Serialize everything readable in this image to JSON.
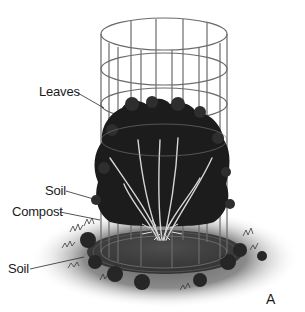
{
  "figure": {
    "panel_letter": "A",
    "labels": [
      {
        "id": "leaves",
        "text": "Leaves"
      },
      {
        "id": "soil-upper",
        "text": "Soil"
      },
      {
        "id": "compost",
        "text": "Compost"
      },
      {
        "id": "soil-lower",
        "text": "Soil"
      }
    ],
    "components": {
      "cage": "wire-cylinder-cage-icon",
      "plant": "rose-bush-icon",
      "ground": "ground-shadow"
    },
    "colors": {
      "background": "#ffffff",
      "wire": "#6b6b6b",
      "foliage": "#1c1c1c",
      "stems": "#d6d6d6",
      "ground_shadow": "#8a8a8a",
      "text": "#1a1a1a"
    }
  }
}
